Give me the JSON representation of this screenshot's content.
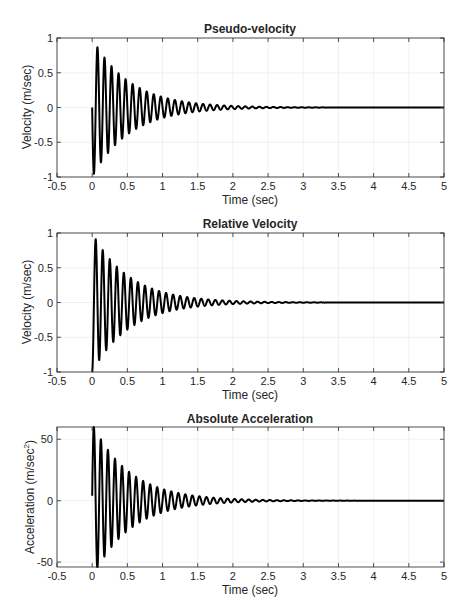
{
  "figure": {
    "background": "#ffffff",
    "line_color": "#000000",
    "grid_color": "#ebebeb",
    "axis_color": "#262626"
  },
  "chart_data": [
    {
      "type": "line",
      "title": "Pseudo-velocity",
      "xlabel": "Time (sec)",
      "ylabel": "Velocity (m/sec)",
      "xlim": [
        -0.5,
        5
      ],
      "ylim": [
        -1,
        1
      ],
      "xticks": [
        -0.5,
        0,
        0.5,
        1,
        1.5,
        2,
        2.5,
        3,
        3.5,
        4,
        4.5,
        5
      ],
      "xtick_labels": [
        "-0.5",
        "0",
        "0.5",
        "1",
        "1.5",
        "2",
        "2.5",
        "3",
        "3.5",
        "4",
        "4.5",
        "5"
      ],
      "yticks": [
        -1,
        -0.5,
        0,
        0.5,
        1
      ],
      "ytick_labels": [
        "-1",
        "-0.5",
        "0",
        "0.5",
        "1"
      ],
      "grid": true,
      "legend": null,
      "series": [
        {
          "name": "pseudo-velocity",
          "model": "damped_sine",
          "t_start": 0,
          "t_end": 5,
          "amplitude": -1.0,
          "frequency_hz": 10,
          "damping_ratio": 0.03,
          "offset": 0,
          "key_points": [
            [
              0,
              0
            ],
            [
              0.02,
              -0.95
            ],
            [
              0.07,
              0.87
            ],
            [
              0.12,
              -0.79
            ],
            [
              0.17,
              0.72
            ],
            [
              0.27,
              0.6
            ],
            [
              0.36,
              0.5
            ],
            [
              0.46,
              0.42
            ],
            [
              1.0,
              0.15
            ],
            [
              1.5,
              0.06
            ],
            [
              2.0,
              0.02
            ],
            [
              3.0,
              0.0
            ],
            [
              5.0,
              0.0
            ]
          ]
        }
      ]
    },
    {
      "type": "line",
      "title": "Relative Velocity",
      "xlabel": "Time (sec)",
      "ylabel": "Velocity (m/sec)",
      "xlim": [
        -0.5,
        5
      ],
      "ylim": [
        -1,
        1
      ],
      "xticks": [
        -0.5,
        0,
        0.5,
        1,
        1.5,
        2,
        2.5,
        3,
        3.5,
        4,
        4.5,
        5
      ],
      "xtick_labels": [
        "-0.5",
        "0",
        "0.5",
        "1",
        "1.5",
        "2",
        "2.5",
        "3",
        "3.5",
        "4",
        "4.5",
        "5"
      ],
      "yticks": [
        -1,
        -0.5,
        0,
        0.5,
        1
      ],
      "ytick_labels": [
        "-1",
        "-0.5",
        "0",
        "0.5",
        "1"
      ],
      "grid": true,
      "legend": null,
      "series": [
        {
          "name": "relative-velocity",
          "model": "damped_cosine",
          "t_start": 0,
          "t_end": 5,
          "amplitude": -1.0,
          "frequency_hz": 10,
          "damping_ratio": 0.03,
          "offset": 0,
          "key_points": [
            [
              0,
              -1.0
            ],
            [
              0.05,
              0.91
            ],
            [
              0.1,
              -0.83
            ],
            [
              0.15,
              0.75
            ],
            [
              0.2,
              -0.69
            ],
            [
              0.5,
              0.39
            ],
            [
              1.0,
              0.15
            ],
            [
              1.5,
              0.06
            ],
            [
              2.0,
              0.02
            ],
            [
              3.0,
              0.0
            ],
            [
              5.0,
              0.0
            ]
          ]
        }
      ]
    },
    {
      "type": "line",
      "title": "Absolute Acceleration",
      "xlabel": "Time (sec)",
      "ylabel": "Acceleration (m/sec",
      "ylabel_superscript": "2",
      "ylabel_suffix": ")",
      "xlim": [
        -0.5,
        5
      ],
      "ylim": [
        -54,
        60
      ],
      "xticks": [
        -0.5,
        0,
        0.5,
        1,
        1.5,
        2,
        2.5,
        3,
        3.5,
        4,
        4.5,
        5
      ],
      "xtick_labels": [
        "-0.5",
        "0",
        "0.5",
        "1",
        "1.5",
        "2",
        "2.5",
        "3",
        "3.5",
        "4",
        "4.5",
        "5"
      ],
      "yticks": [
        -50,
        0,
        50
      ],
      "ytick_labels": [
        "-50",
        "0",
        "50"
      ],
      "grid": true,
      "legend": null,
      "series": [
        {
          "name": "absolute-acceleration",
          "model": "damped_sine",
          "t_start": 0,
          "t_end": 5,
          "amplitude": 63,
          "frequency_hz": 10,
          "damping_ratio": 0.03,
          "offset": 0,
          "initial_value": 4,
          "key_points": [
            [
              0,
              4
            ],
            [
              0.025,
              60
            ],
            [
              0.075,
              -56
            ],
            [
              0.125,
              50
            ],
            [
              0.175,
              -45
            ],
            [
              0.225,
              41
            ],
            [
              0.5,
              24
            ],
            [
              1.0,
              9
            ],
            [
              1.5,
              3.5
            ],
            [
              2.0,
              1.3
            ],
            [
              3.0,
              0.0
            ],
            [
              5.0,
              0.0
            ]
          ]
        }
      ]
    }
  ]
}
